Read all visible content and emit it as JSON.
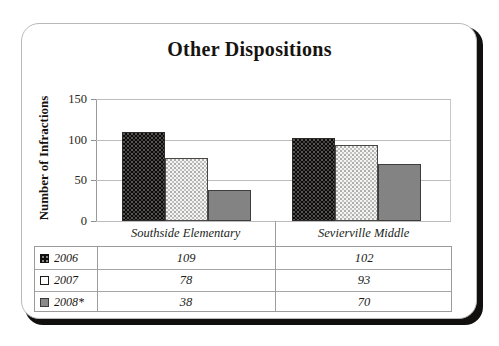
{
  "chart_data": {
    "type": "bar",
    "title": "Other Dispositions",
    "xlabel": "",
    "ylabel": "Number of Infractions",
    "ylim": [
      0,
      150
    ],
    "yticks": [
      0,
      50,
      100,
      150
    ],
    "ytick_labels": [
      "0",
      "50",
      "100",
      "150"
    ],
    "grid": true,
    "legend_position": "table-below",
    "categories": [
      "Southside Elementary",
      "Sevierville Middle"
    ],
    "series": [
      {
        "name": "2006",
        "values": [
          109,
          102
        ],
        "color": "#0d0b0a",
        "pattern": "dotted-dark"
      },
      {
        "name": "2007",
        "values": [
          78,
          93
        ],
        "color": "#f4f4f2",
        "pattern": "dotted-light"
      },
      {
        "name": "2008*",
        "values": [
          38,
          70
        ],
        "color": "#838383",
        "pattern": "solid"
      }
    ]
  },
  "table": {
    "header_row": [
      "Southside Elementary",
      "Sevierville Middle"
    ],
    "rows": [
      {
        "label": "2006",
        "swatch": "legend-swatch-2006",
        "values": [
          "109",
          "102"
        ]
      },
      {
        "label": "2007",
        "swatch": "legend-swatch-2007",
        "values": [
          "78",
          "93"
        ]
      },
      {
        "label": "2008*",
        "swatch": "legend-swatch-2008",
        "values": [
          "38",
          "70"
        ]
      }
    ]
  }
}
